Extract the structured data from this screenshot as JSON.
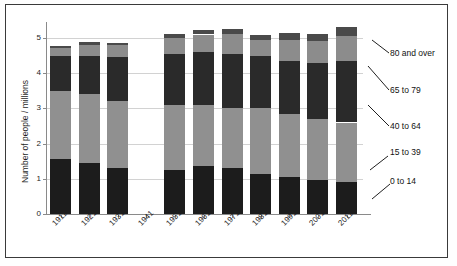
{
  "chart_data": {
    "type": "bar",
    "subtype": "stacked-bar",
    "title": "",
    "xlabel": "",
    "ylabel": "Number of people / millions",
    "ylim": [
      0,
      5.6
    ],
    "yticks": [
      0,
      1,
      2,
      3,
      4,
      5
    ],
    "grid": true,
    "legend_position": "right-with-leader-lines",
    "categories": [
      "1911",
      "1921",
      "1931",
      "1941",
      "1951",
      "1961",
      "1971",
      "1981",
      "1991",
      "2001",
      "2011"
    ],
    "series": [
      {
        "name": "0 to 14",
        "color": "#1c1c1c",
        "values": [
          1.55,
          1.45,
          1.3,
          0,
          1.25,
          1.35,
          1.3,
          1.15,
          1.05,
          0.98,
          0.92
        ]
      },
      {
        "name": "15 to 39",
        "color": "#909090",
        "values": [
          1.95,
          1.95,
          1.9,
          0,
          1.85,
          1.75,
          1.7,
          1.85,
          1.8,
          1.72,
          1.68
        ]
      },
      {
        "name": "40 to 64",
        "color": "#2a2a2a",
        "values": [
          1.0,
          1.1,
          1.25,
          0,
          1.45,
          1.5,
          1.55,
          1.5,
          1.5,
          1.6,
          1.75
        ]
      },
      {
        "name": "65 to 79",
        "color": "#8c8c8c",
        "values": [
          0.22,
          0.3,
          0.34,
          0,
          0.45,
          0.5,
          0.55,
          0.45,
          0.6,
          0.62,
          0.7
        ]
      },
      {
        "name": "80 and over",
        "color": "#4a4a4a",
        "values": [
          0.05,
          0.08,
          0.08,
          0,
          0.1,
          0.12,
          0.15,
          0.15,
          0.18,
          0.2,
          0.25
        ]
      }
    ],
    "totals": [
      4.77,
      4.88,
      4.87,
      0,
      5.1,
      5.22,
      5.25,
      5.1,
      5.13,
      5.12,
      5.3
    ]
  },
  "legend": {
    "items": [
      {
        "label": "80 and over"
      },
      {
        "label": "65 to 79"
      },
      {
        "label": "40 to 64"
      },
      {
        "label": "15 to 39"
      },
      {
        "label": "0 to 14"
      }
    ]
  },
  "axis": {
    "y_title": "Number of people / millions",
    "y_tick_labels": [
      "0",
      "1",
      "2",
      "3",
      "4",
      "5"
    ],
    "x_tick_labels": [
      "1911",
      "1921",
      "1931",
      "1941",
      "1951",
      "1961",
      "1971",
      "1981",
      "1991",
      "2001",
      "2011"
    ]
  }
}
